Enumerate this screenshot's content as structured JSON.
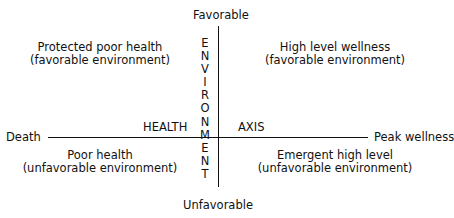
{
  "axes": {
    "top": "Favorable",
    "bottom": "Unfavorable",
    "left": "Death",
    "right": "Peak wellness",
    "horizontal_label_left": "HEALTH",
    "horizontal_label_right": "AXIS",
    "vertical_label": "ENVIRONMENT"
  },
  "quadrants": {
    "top_left": {
      "line1": "Protected poor health",
      "line2": "(favorable environment)"
    },
    "top_right": {
      "line1": "High level wellness",
      "line2": "(favorable environment)"
    },
    "bottom_left": {
      "line1": "Poor health",
      "line2": "(unfavorable environment)"
    },
    "bottom_right": {
      "line1": "Emergent high level",
      "line2": "(unfavorable environment)"
    }
  }
}
